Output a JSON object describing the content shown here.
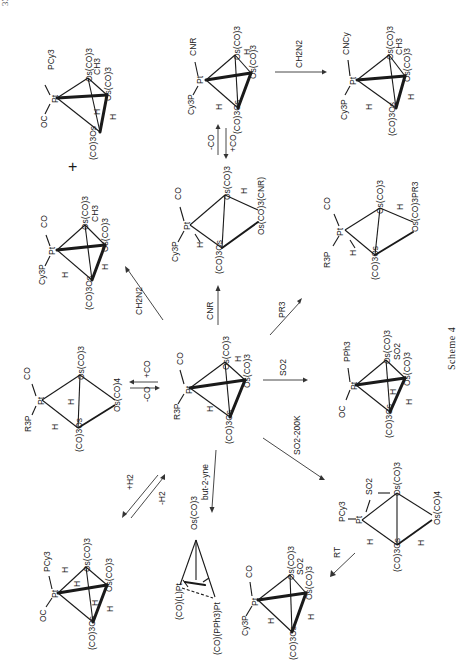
{
  "page": {
    "page_number_partial": "334",
    "orientation": "rotated 90° counter-clockwise",
    "caption": "Scheme 4"
  },
  "center_complex": {
    "ligands": [
      "R3P",
      "CO",
      "Pt",
      "H",
      "Os(CO)3",
      "H",
      "Os(CO)3",
      "(CO)3Os"
    ]
  },
  "structures": [
    {
      "id": "top-left",
      "labels": [
        "PCy3",
        "OC",
        "Pt",
        "Os(CO)3",
        "CH3",
        "Os(CO)3",
        "H",
        "H",
        "(CO)3Os"
      ]
    },
    {
      "id": "top-middle",
      "labels": [
        "CNR",
        "Cy3P",
        "Pt",
        "Os(CO)3",
        "H",
        "Os(CO)3",
        "H",
        "(CO)3Os"
      ]
    },
    {
      "id": "top-right",
      "labels": [
        "CNCy",
        "Cy3P",
        "Pt",
        "Os(CO)3",
        "CH3",
        "Os(CO)3",
        "H",
        "H",
        "(CO)3Os"
      ]
    },
    {
      "id": "mid-left",
      "labels": [
        "CO",
        "Cy3P",
        "Pt",
        "Os(CO)3",
        "CH3",
        "Os(CO)3",
        "H",
        "H",
        "(CO)3Os"
      ]
    },
    {
      "id": "mid-middle",
      "labels": [
        "CO",
        "Cy3P",
        "Pt",
        "Os(CO)3",
        "H",
        "Os(CO)3(CNR)",
        "H",
        "(CO)3Os"
      ]
    },
    {
      "id": "mid-right",
      "labels": [
        "CO",
        "R3P",
        "Pt",
        "Os(CO)3",
        "H",
        "Os(CO)3PR3",
        "H",
        "(CO)3Os"
      ]
    },
    {
      "id": "left-middle",
      "labels": [
        "CO",
        "R3P",
        "Pt",
        "Os(CO)3",
        "H",
        "Os(CO)4",
        "H",
        "(CO)3Os"
      ]
    },
    {
      "id": "right-middle",
      "labels": [
        "PPh3",
        "OC",
        "Pt",
        "Os(CO)3",
        "SO2",
        "Os(CO)3",
        "H",
        "H",
        "(CO)3Os"
      ]
    },
    {
      "id": "bottom-left",
      "labels": [
        "PCy3",
        "OC",
        "Pt",
        "H",
        "H",
        "Os(CO)3",
        "Os(CO)3",
        "H",
        "H",
        "(CO)3Os"
      ]
    },
    {
      "id": "bottom-middle-alkyne",
      "labels": [
        "Os(CO)3",
        "(CO)(L)Pt",
        "(CO)(PPh3)Pt"
      ]
    },
    {
      "id": "bottom-middle-so2",
      "labels": [
        "CO",
        "Cy3P",
        "Pt",
        "Os(CO)3",
        "SO2",
        "Os(CO)3",
        "H",
        "H",
        "(CO)3Os"
      ]
    },
    {
      "id": "bottom-right",
      "labels": [
        "SO2",
        "PCy3",
        "Pt",
        "Os(CO)3",
        "Os(CO)4",
        "H",
        "H",
        "(CO)3Os"
      ]
    }
  ],
  "reagents": {
    "ch2n2_top": "CH2N2",
    "minus_co": "-CO",
    "plus_co": "+CO",
    "cnr": "CNR",
    "pr3": "PR3",
    "ch2n2_left": "CH2N2",
    "plus_co_left": "+CO",
    "minus_co_left": "-CO",
    "so2": "SO2",
    "so2_200k": "SO2-200K",
    "plus_h2": "+H2",
    "minus_h2": "-H2",
    "but2yne": "but-2-yne",
    "rt": "RT"
  },
  "plus_sign": "+"
}
